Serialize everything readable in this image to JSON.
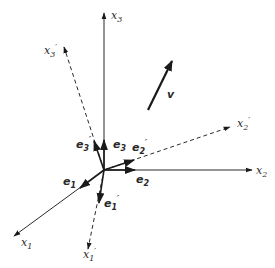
{
  "figure": {
    "colors": {
      "ink": "#2a2a2a",
      "background": "#ffffff"
    },
    "axes": [
      {
        "id": "x1",
        "base": "x",
        "sub": "1",
        "prime": false,
        "style": "solid"
      },
      {
        "id": "x2",
        "base": "x",
        "sub": "2",
        "prime": false,
        "style": "solid"
      },
      {
        "id": "x3",
        "base": "x",
        "sub": "3",
        "prime": false,
        "style": "solid"
      },
      {
        "id": "x1p",
        "base": "x",
        "sub": "1",
        "prime": true,
        "style": "dashed"
      },
      {
        "id": "x2p",
        "base": "x",
        "sub": "2",
        "prime": true,
        "style": "dashed"
      },
      {
        "id": "x3p",
        "base": "x",
        "sub": "3",
        "prime": true,
        "style": "dashed"
      }
    ],
    "basis_vectors": [
      {
        "id": "e1",
        "base": "e",
        "sub": "1",
        "prime": false
      },
      {
        "id": "e2",
        "base": "e",
        "sub": "2",
        "prime": false
      },
      {
        "id": "e3",
        "base": "e",
        "sub": "3",
        "prime": false
      },
      {
        "id": "e1p",
        "base": "e",
        "sub": "1",
        "prime": true
      },
      {
        "id": "e2p",
        "base": "e",
        "sub": "2",
        "prime": true
      },
      {
        "id": "e3p",
        "base": "e",
        "sub": "3",
        "prime": true
      }
    ],
    "vector": {
      "id": "v",
      "label": "v"
    }
  }
}
